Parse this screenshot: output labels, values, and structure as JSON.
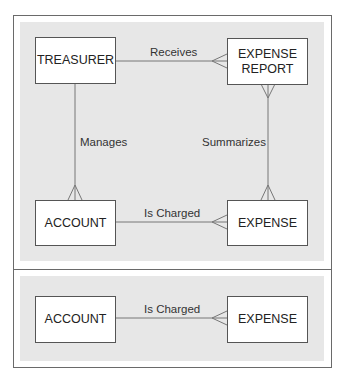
{
  "diagrams": [
    {
      "entities": [
        {
          "id": "treasurer",
          "label": "TREASURER"
        },
        {
          "id": "expense_report",
          "label": "EXPENSE\nREPORT"
        },
        {
          "id": "account",
          "label": "ACCOUNT"
        },
        {
          "id": "expense",
          "label": "EXPENSE"
        }
      ],
      "relationships": [
        {
          "label": "Receives",
          "from": "TREASURER",
          "to": "EXPENSE REPORT",
          "cardinality": "one-to-many"
        },
        {
          "label": "Manages",
          "from": "TREASURER",
          "to": "ACCOUNT",
          "cardinality": "one-to-many"
        },
        {
          "label": "Summarizes",
          "from": "EXPENSE",
          "to": "EXPENSE REPORT",
          "cardinality": "many-to-many"
        },
        {
          "label": "Is Charged",
          "from": "ACCOUNT",
          "to": "EXPENSE",
          "cardinality": "one-to-many"
        }
      ]
    },
    {
      "entities": [
        {
          "id": "account",
          "label": "ACCOUNT"
        },
        {
          "id": "expense",
          "label": "EXPENSE"
        }
      ],
      "relationships": [
        {
          "label": "Is Charged",
          "from": "ACCOUNT",
          "to": "EXPENSE",
          "cardinality": "one-to-many"
        }
      ]
    }
  ],
  "colors": {
    "panel": "#e7e7e7",
    "border": "#6a6a6a",
    "line": "#777777",
    "entity_fill": "#ffffff"
  }
}
